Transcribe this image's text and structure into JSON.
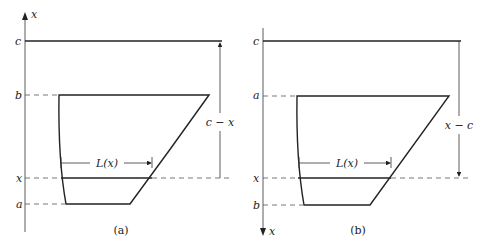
{
  "panels": [
    {
      "caption": "(a)",
      "axis_label": "x",
      "axis_direction": "up",
      "levels": {
        "top": "c",
        "upper": "b",
        "mid": "x",
        "lower": "a"
      },
      "width_label": "L(x)",
      "dimension_label": "c − x"
    },
    {
      "caption": "(b)",
      "axis_label": "x",
      "axis_direction": "down",
      "levels": {
        "top": "c",
        "upper": "a",
        "mid": "x",
        "lower": "b"
      },
      "width_label": "L(x)",
      "dimension_label": "x − c"
    }
  ]
}
